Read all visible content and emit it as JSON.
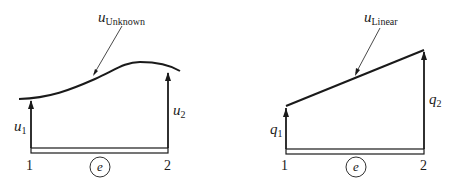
{
  "diagrams": [
    {
      "id": "unknown",
      "curve_label_main": "u",
      "curve_label_sub": "Unknown",
      "left_value_main": "u",
      "left_value_sub": "1",
      "right_value_main": "u",
      "right_value_sub": "2",
      "node_left": "1",
      "node_right": "2",
      "element_label": "e"
    },
    {
      "id": "linear",
      "curve_label_main": "u",
      "curve_label_sub": "Linear",
      "left_value_main": "q",
      "left_value_sub": "1",
      "right_value_main": "q",
      "right_value_sub": "2",
      "node_left": "1",
      "node_right": "2",
      "element_label": "e"
    }
  ],
  "colors": {
    "ink": "#1a1a1a",
    "background": "#ffffff"
  }
}
